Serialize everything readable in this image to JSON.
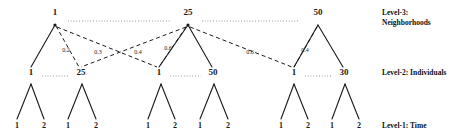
{
  "figure": {
    "width": 459,
    "height": 140,
    "stroke_color": "#1a1a1a",
    "background": "#ffffff"
  },
  "levels": [
    {
      "id": "level-3",
      "caption_line1": "Level-3:",
      "caption_line2": "Neighborhoods",
      "y": 25
    },
    {
      "id": "level-2",
      "caption_line1": "Level-2: Individuals",
      "caption_line2": "",
      "y": 78
    },
    {
      "id": "level-1",
      "caption_line1": "Level-1: Time",
      "caption_line2": "",
      "y": 125
    }
  ],
  "level3_nodes": [
    {
      "label": "1",
      "x": 55,
      "y": 12
    },
    {
      "label": "25",
      "x": 188,
      "y": 12
    },
    {
      "label": "50",
      "x": 318,
      "y": 12
    }
  ],
  "level2_nodes": [
    {
      "label": "1",
      "x": 31,
      "y": 72
    },
    {
      "label": "25",
      "x": 79,
      "y": 72
    },
    {
      "label": "1",
      "x": 159,
      "y": 72
    },
    {
      "label": "50",
      "x": 212,
      "y": 72
    },
    {
      "label": "1",
      "x": 294,
      "y": 72
    },
    {
      "label": "30",
      "x": 343,
      "y": 72
    }
  ],
  "level1_nodes": [
    {
      "label": "1",
      "x": 17,
      "y": 125
    },
    {
      "label": "2",
      "x": 44,
      "y": 125
    },
    {
      "label": "1",
      "x": 68,
      "y": 125
    },
    {
      "label": "2",
      "x": 96,
      "y": 125
    },
    {
      "label": "1",
      "x": 148,
      "y": 125
    },
    {
      "label": "2",
      "x": 175,
      "y": 125
    },
    {
      "label": "1",
      "x": 200,
      "y": 125
    },
    {
      "label": "2",
      "x": 228,
      "y": 125
    },
    {
      "label": "1",
      "x": 281,
      "y": 125
    },
    {
      "label": "2",
      "x": 308,
      "y": 125
    },
    {
      "label": "1",
      "x": 332,
      "y": 125
    },
    {
      "label": "2",
      "x": 359,
      "y": 125
    }
  ],
  "edge_weights": [
    {
      "label": "0.2",
      "x": 66,
      "y": 50
    },
    {
      "label": "0.3",
      "x": 98,
      "y": 52
    },
    {
      "label": "0.4",
      "x": 138,
      "y": 52
    },
    {
      "label": "0.6",
      "x": 168,
      "y": 48
    },
    {
      "label": "0.6",
      "x": 250,
      "y": 52
    },
    {
      "label": "0.4",
      "x": 305,
      "y": 50
    }
  ],
  "captions": {
    "level3_line1": "Level-3:",
    "level3_line2": "Neighborhoods",
    "level2": "Level-2: Individuals",
    "level1": "Level-1: Time"
  }
}
